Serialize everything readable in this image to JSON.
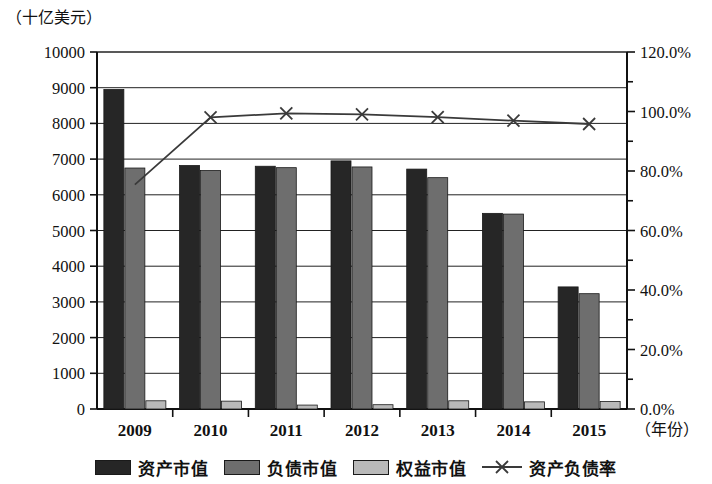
{
  "unit_label": "（十亿美元）",
  "x_axis_name": "（年份）",
  "chart_data": {
    "type": "bar",
    "title": "",
    "subtitle": "",
    "xlabel": "（年份）",
    "ylabel": "（十亿美元）",
    "y2label": "",
    "grid": true,
    "legend_position": "bottom",
    "categories": [
      "2009",
      "2010",
      "2011",
      "2012",
      "2013",
      "2014",
      "2015"
    ],
    "ylim": [
      0,
      10000
    ],
    "y_ticks": [
      0,
      1000,
      2000,
      3000,
      4000,
      5000,
      6000,
      7000,
      8000,
      9000,
      10000
    ],
    "y_tick_labels": [
      "0",
      "1000",
      "2000",
      "3000",
      "4000",
      "5000",
      "6000",
      "7000",
      "8000",
      "9000",
      "10000"
    ],
    "y2lim": [
      0,
      120
    ],
    "y2_ticks": [
      0,
      20,
      40,
      60,
      80,
      100,
      120
    ],
    "y2_tick_labels": [
      "0.0%",
      "20.0%",
      "40.0%",
      "60.0%",
      "80.0%",
      "100.0%",
      "120.0%"
    ],
    "series": [
      {
        "name": "资产市值",
        "type": "bar",
        "axis": "left",
        "color": "#262626",
        "values": [
          8950,
          6820,
          6800,
          6950,
          6720,
          5480,
          3420
        ]
      },
      {
        "name": "负债市值",
        "type": "bar",
        "axis": "left",
        "color": "#6e6e6e",
        "values": [
          6750,
          6680,
          6760,
          6780,
          6480,
          5460,
          3230
        ]
      },
      {
        "name": "权益市值",
        "type": "bar",
        "axis": "left",
        "color": "#b9b9b9",
        "values": [
          230,
          220,
          110,
          120,
          230,
          200,
          210
        ]
      },
      {
        "name": "资产负债率",
        "type": "line",
        "axis": "right",
        "color": "#3a3a3a",
        "marker": "x",
        "values": [
          75.4,
          98.0,
          99.4,
          99.0,
          98.1,
          96.9,
          95.8
        ]
      }
    ]
  },
  "legend": [
    {
      "label": "资产市值",
      "swatch": "dark-bar-swatch",
      "color": "#262626"
    },
    {
      "label": "负债市值",
      "swatch": "mid-bar-swatch",
      "color": "#6e6e6e"
    },
    {
      "label": "权益市值",
      "swatch": "light-bar-swatch",
      "color": "#b9b9b9"
    },
    {
      "label": "资产负债率",
      "swatch": "line-marker-swatch",
      "color": "#3a3a3a"
    }
  ]
}
